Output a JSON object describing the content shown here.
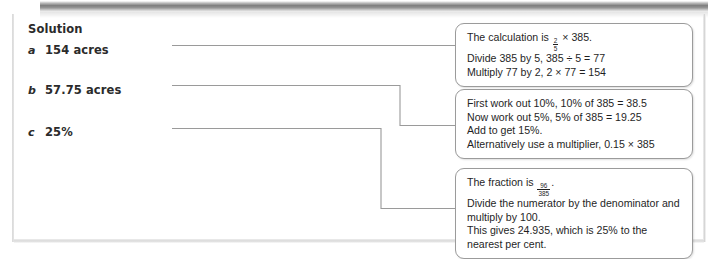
{
  "page": {
    "heading": "Solution"
  },
  "answers": [
    {
      "letter": "a",
      "text": "154 acres"
    },
    {
      "letter": "b",
      "text": "57.75 acres"
    },
    {
      "letter": "c",
      "text": "25%"
    }
  ],
  "callouts": [
    {
      "id": "box1",
      "lines": [
        {
          "before": "The calculation is ",
          "fraction": {
            "numerator": "2",
            "denominator": "5"
          },
          "after": " × 385."
        },
        {
          "text": "Divide 385 by 5, 385 ÷ 5 = 77"
        },
        {
          "text": "Multiply 77 by 2, 2 × 77 = 154"
        }
      ]
    },
    {
      "id": "box2",
      "lines": [
        {
          "text": "First work out 10%, 10% of 385 = 38.5"
        },
        {
          "text": "Now work out 5%, 5% of 385 = 19.25"
        },
        {
          "text": "Add to get 15%."
        },
        {
          "text": "Alternatively use a multiplier, 0.15 × 385"
        }
      ]
    },
    {
      "id": "box3",
      "lines": [
        {
          "before": "The fraction is ",
          "fraction": {
            "numerator": "96",
            "denominator": "385"
          },
          "after": "."
        },
        {
          "text": "Divide the numerator by the denominator and multiply by 100."
        },
        {
          "text": "This gives 24.935, which is 25% to the nearest per cent."
        }
      ]
    }
  ],
  "connectors": {
    "stroke_color": "#9a9a9a",
    "paths": [
      "M 172 45.5 L 455 45.5",
      "M 172 85.5 L 400 85.5 L 400 125.5 L 455 125.5",
      "M 172 128.5 L 381 128.5 L 381 208.5 L 455 208.5"
    ]
  },
  "colors": {
    "text": "#1f1f1f",
    "heading": "#2b2b2b",
    "box_border": "#9b9b9b",
    "page_background": "#ffffff"
  }
}
